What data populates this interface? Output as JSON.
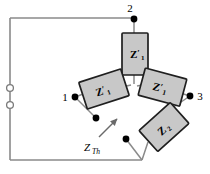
{
  "figure": {
    "name": "thevenin-impedance-network",
    "background_color": "#ffffff",
    "wire_color": "#808080",
    "box_fill_color": "#c8c8c8",
    "box_stroke_color": "#1a1a1a",
    "node_color": "#000000",
    "text_color": "#000000"
  },
  "impedances": [
    {
      "id": "z1-prime-top",
      "symbol": "Z",
      "prime": "′",
      "subscript": "1",
      "full_label": "Z′1",
      "position": "top-center",
      "rotation_deg": 0
    },
    {
      "id": "z1-prime-left",
      "symbol": "Z",
      "prime": "′",
      "subscript": "1",
      "full_label": "Z′1",
      "position": "left",
      "rotation_deg": -18
    },
    {
      "id": "z1-prime-right",
      "symbol": "Z",
      "prime": "′",
      "subscript": "1",
      "full_label": "Z′1",
      "position": "right",
      "rotation_deg": 15
    },
    {
      "id": "z2-lower-right",
      "symbol": "Z",
      "prime": "",
      "subscript": "2",
      "full_label": "Z2",
      "position": "lower-right",
      "rotation_deg": -42
    }
  ],
  "terminals": [
    {
      "id": "terminal-1",
      "label": "1",
      "position": "left"
    },
    {
      "id": "terminal-2",
      "label": "2",
      "position": "top"
    },
    {
      "id": "terminal-3",
      "label": "3",
      "position": "right"
    }
  ],
  "annotation": {
    "id": "z-thevenin",
    "symbol": "Z",
    "subscript": "Th",
    "full_label": "ZTh",
    "arrow": "up-right"
  },
  "terminal_posts": {
    "count": 2,
    "style": "open-circle",
    "side": "left"
  }
}
